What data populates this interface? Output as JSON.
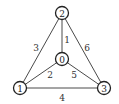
{
  "graph": {
    "nodes": [
      {
        "id": "0",
        "label": "0",
        "x": 62,
        "y": 59
      },
      {
        "id": "1",
        "label": "1",
        "x": 20,
        "y": 88
      },
      {
        "id": "2",
        "label": "2",
        "x": 62,
        "y": 13
      },
      {
        "id": "3",
        "label": "3",
        "x": 104,
        "y": 88
      }
    ],
    "edges": [
      {
        "from": "2",
        "to": "0",
        "weight": "1",
        "label_x": 67,
        "label_y": 40
      },
      {
        "from": "1",
        "to": "0",
        "weight": "2",
        "label_x": 50,
        "label_y": 75
      },
      {
        "from": "2",
        "to": "1",
        "weight": "3",
        "label_x": 36,
        "label_y": 48
      },
      {
        "from": "1",
        "to": "3",
        "weight": "4",
        "label_x": 62,
        "label_y": 98
      },
      {
        "from": "0",
        "to": "3",
        "weight": "5",
        "label_x": 74,
        "label_y": 75
      },
      {
        "from": "2",
        "to": "3",
        "weight": "6",
        "label_x": 87,
        "label_y": 48
      }
    ],
    "colors": {
      "edge": "#4a4a4a",
      "node_stroke": "#222222",
      "node_fill": "#ffffff",
      "text": "#222222"
    }
  }
}
